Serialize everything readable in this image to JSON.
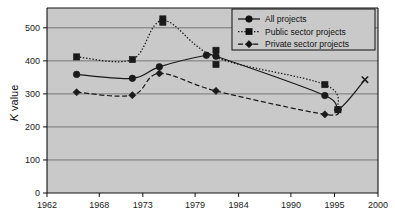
{
  "chart_data": {
    "type": "line",
    "title": "",
    "xlabel": "",
    "ylabel": "K value",
    "ylabel_main": "K",
    "ylabel_rest": " value",
    "xlim": [
      1962,
      2000
    ],
    "ylim": [
      0,
      560
    ],
    "y_ticks": [
      0,
      100,
      200,
      300,
      400,
      500
    ],
    "x_ticks": [
      1962,
      1968,
      1973,
      1979,
      1984,
      1990,
      1995,
      2000
    ],
    "y_tick_labels": [
      "0",
      "100",
      "200",
      "300",
      "400",
      "500"
    ],
    "x_tick_labels": [
      "1962",
      "1968",
      "1973",
      "1979",
      "1984",
      "1990",
      "1995",
      "2000"
    ],
    "grid": "horizontal",
    "legend_position": "top-right",
    "plot_background": "#c9c9c9",
    "series": [
      {
        "name": "All projects",
        "marker": "circle",
        "line_style": "solid",
        "color": "#1a1a1a",
        "points": [
          {
            "x": 1965.4,
            "y": 359
          },
          {
            "x": 1971.8,
            "y": 347
          },
          {
            "x": 1974.9,
            "y": 382
          },
          {
            "x": 1980.3,
            "y": 417
          },
          {
            "x": 1981.4,
            "y": 414
          },
          {
            "x": 1993.9,
            "y": 295
          },
          {
            "x": 1995.4,
            "y": 252
          },
          {
            "x": 1998.5,
            "y": 343
          }
        ]
      },
      {
        "name": "Public sector projects",
        "marker": "square",
        "line_style": "dotted",
        "color": "#1a1a1a",
        "points": [
          {
            "x": 1965.4,
            "y": 412
          },
          {
            "x": 1971.8,
            "y": 404
          },
          {
            "x": 1975.3,
            "y": 527
          },
          {
            "x": 1975.3,
            "y": 517
          },
          {
            "x": 1981.4,
            "y": 432
          },
          {
            "x": 1981.4,
            "y": 389
          },
          {
            "x": 1993.9,
            "y": 328
          },
          {
            "x": 1995.4,
            "y": 252
          }
        ]
      },
      {
        "name": "Private sector projects",
        "marker": "diamond",
        "line_style": "dashed",
        "color": "#1a1a1a",
        "points": [
          {
            "x": 1965.4,
            "y": 305
          },
          {
            "x": 1971.8,
            "y": 296
          },
          {
            "x": 1974.9,
            "y": 362
          },
          {
            "x": 1981.4,
            "y": 309
          },
          {
            "x": 1993.9,
            "y": 238
          },
          {
            "x": 1995.4,
            "y": 252
          }
        ]
      }
    ],
    "legend_entries": [
      {
        "label": "All projects",
        "marker": "circle",
        "line_style": "solid"
      },
      {
        "label": "Public sector projects",
        "marker": "square",
        "line_style": "dotted"
      },
      {
        "label": "Private sector projects",
        "marker": "diamond",
        "line_style": "dashed"
      }
    ]
  }
}
